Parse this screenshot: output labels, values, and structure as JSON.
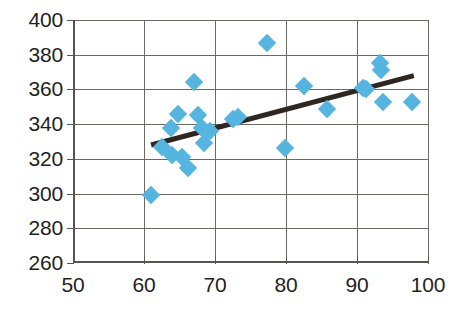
{
  "chart_data": {
    "type": "scatter",
    "title": "",
    "xlabel": "",
    "ylabel": "",
    "xlim": [
      50,
      100
    ],
    "ylim": [
      260,
      400
    ],
    "xticks": [
      50,
      60,
      70,
      80,
      90,
      100
    ],
    "yticks": [
      260,
      280,
      300,
      320,
      340,
      360,
      380,
      400
    ],
    "xtick_labels": [
      "50",
      "60",
      "70",
      "80",
      "90",
      "100"
    ],
    "ytick_labels": [
      "260",
      "280",
      "300",
      "320",
      "340",
      "360",
      "380",
      "400"
    ],
    "grid": true,
    "legend": false,
    "marker_color": "#56b4e0",
    "marker_shape": "diamond",
    "axis_color": "#55554e",
    "grid_color": "#6a6a62",
    "points": [
      {
        "x": 61.0,
        "y": 299
      },
      {
        "x": 62.6,
        "y": 327
      },
      {
        "x": 63.8,
        "y": 338
      },
      {
        "x": 64.0,
        "y": 322
      },
      {
        "x": 64.8,
        "y": 346
      },
      {
        "x": 65.3,
        "y": 321
      },
      {
        "x": 66.2,
        "y": 315
      },
      {
        "x": 67.0,
        "y": 364
      },
      {
        "x": 67.6,
        "y": 345
      },
      {
        "x": 68.1,
        "y": 338
      },
      {
        "x": 68.4,
        "y": 329
      },
      {
        "x": 69.3,
        "y": 336
      },
      {
        "x": 72.6,
        "y": 343
      },
      {
        "x": 73.3,
        "y": 344
      },
      {
        "x": 77.3,
        "y": 387
      },
      {
        "x": 79.9,
        "y": 326
      },
      {
        "x": 82.6,
        "y": 362
      },
      {
        "x": 85.8,
        "y": 349
      },
      {
        "x": 90.9,
        "y": 361
      },
      {
        "x": 91.2,
        "y": 360
      },
      {
        "x": 93.2,
        "y": 375
      },
      {
        "x": 93.4,
        "y": 371
      },
      {
        "x": 93.6,
        "y": 353
      },
      {
        "x": 97.8,
        "y": 353
      }
    ],
    "trendline": {
      "type": "linear",
      "color": "#2e2620",
      "width": 5,
      "x_start": 61.0,
      "y_start": 328,
      "x_end": 98.0,
      "y_end": 368
    }
  }
}
